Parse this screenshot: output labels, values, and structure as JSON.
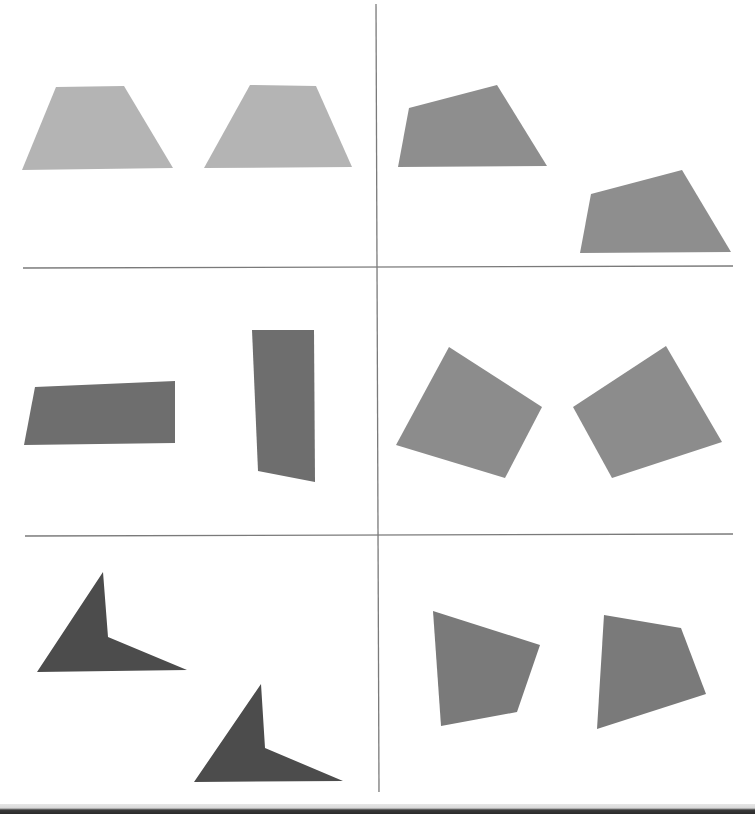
{
  "figure": {
    "title": "",
    "layout": {
      "rows": 3,
      "cols": 2
    },
    "divider_color": "#7a7a7a",
    "dividers": {
      "vertical": {
        "x1": 376,
        "y1": 4,
        "x2": 379,
        "y2": 792
      },
      "horizontal": [
        {
          "x1": 23,
          "y1": 268,
          "x2": 733,
          "y2": 266
        },
        {
          "x1": 25,
          "y1": 536,
          "x2": 733,
          "y2": 534
        }
      ]
    },
    "panels": [
      {
        "id": "row1-left",
        "color": "#b4b4b4",
        "shapes": [
          {
            "points": "56,87 124,86 173,168 22,170"
          },
          {
            "points": "250,85 316,86 352,167 204,168"
          }
        ]
      },
      {
        "id": "row1-right",
        "color": "#8e8e8e",
        "shapes": [
          {
            "points": "409,108 497,85 547,166 398,167"
          },
          {
            "points": "591,194 682,170 731,252 580,253"
          }
        ]
      },
      {
        "id": "row2-left",
        "color": "#6e6e6e",
        "shapes": [
          {
            "points": "35,387 175,381 175,443 24,445"
          },
          {
            "points": "252,330 314,330 315,482 258,471"
          }
        ]
      },
      {
        "id": "row2-right",
        "color": "#8c8c8c",
        "shapes": [
          {
            "points": "449,347 542,407 505,478 396,445"
          },
          {
            "points": "666,346 722,442 612,478 573,407"
          }
        ]
      },
      {
        "id": "row3-left",
        "color": "#4c4c4c",
        "shapes": [
          {
            "points": "103,572 108,637 187,670 37,672"
          },
          {
            "points": "261,684 265,748 343,781 194,782"
          }
        ]
      },
      {
        "id": "row3-right",
        "color": "#7a7a7a",
        "shapes": [
          {
            "points": "433,611 540,645 517,712 441,726"
          },
          {
            "points": "604,615 681,628 706,694 597,729"
          }
        ]
      }
    ]
  }
}
